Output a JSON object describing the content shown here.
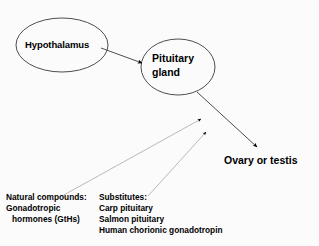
{
  "diagram": {
    "colors": {
      "background": "#fbfbfb",
      "stroke": "#3a3a3a",
      "arrow_fill": "#000000",
      "text": "#000000"
    },
    "nodes": [
      {
        "id": "hypothalamus",
        "label": "Hypothalamus",
        "shape": "ellipse",
        "cx": 62,
        "cy": 45,
        "rx": 46,
        "ry": 27
      },
      {
        "id": "pituitary",
        "label_line_1": "Pituitary",
        "label_line_2": "gland",
        "shape": "ellipse",
        "cx": 178,
        "cy": 67,
        "rx": 37,
        "ry": 28
      }
    ],
    "target": {
      "id": "gonad",
      "label": "Ovary or testis"
    },
    "annotations": {
      "natural_compounds": {
        "heading": "Natural compounds:",
        "lines": [
          "Gonadotropic",
          "hormones (GtHs)"
        ]
      },
      "substitutes": {
        "heading": "Substitutes:",
        "lines": [
          "Carp pituitary",
          "Salmon pituitary",
          "Human chorionic gonadotropin"
        ]
      }
    },
    "connectors": [
      {
        "id": "hypothalamus-to-pituitary",
        "name": "arrow-hypothalamus-to-pituitary",
        "from": "hypothalamus",
        "to": "pituitary"
      },
      {
        "id": "pituitary-to-gonad",
        "name": "arrow-pituitary-to-gonad",
        "from": "pituitary",
        "to": "gonad"
      },
      {
        "id": "natural-compounds-to-axis",
        "name": "arrow-natural-compounds-to-axis",
        "from": "natural_compounds",
        "to": "axis"
      },
      {
        "id": "substitutes-to-axis",
        "name": "arrow-substitutes-to-axis",
        "from": "substitutes",
        "to": "axis"
      }
    ]
  }
}
